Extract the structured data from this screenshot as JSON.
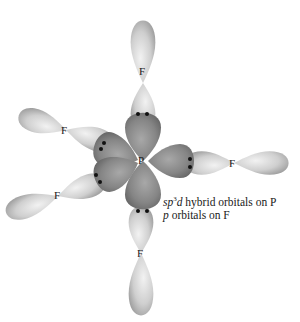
{
  "diagram": {
    "central_atom": "P",
    "ligand_atom": "F",
    "ligands": [
      {
        "position": "axial-top",
        "label": "F"
      },
      {
        "position": "equatorial-upper-left",
        "label": "F"
      },
      {
        "position": "equatorial-right",
        "label": "F"
      },
      {
        "position": "equatorial-lower-left",
        "label": "F"
      },
      {
        "position": "axial-bottom",
        "label": "F"
      }
    ],
    "caption": {
      "line1_prefix": "sp",
      "line1_superscript": "3",
      "line1_italic_d": "d",
      "line1_rest": " hybrid orbitals on P",
      "line2_italic": "p",
      "line2_rest": " orbitals on F"
    },
    "colors": {
      "hybrid_orbital": "#8a8a8a",
      "p_orbital": "#cfcfcf",
      "electron_dot": "#111111",
      "background": "#ffffff"
    }
  }
}
